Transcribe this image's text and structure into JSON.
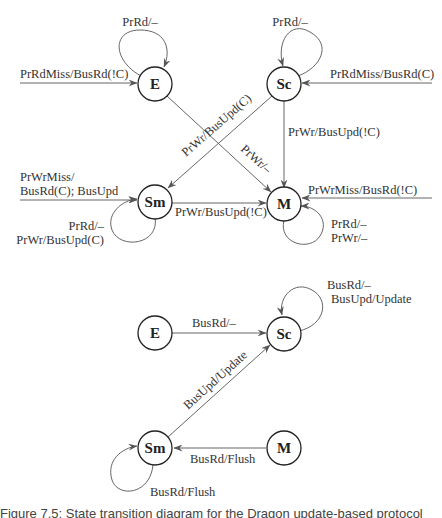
{
  "diagram_top": {
    "nodes": {
      "E": {
        "label": "E"
      },
      "Sc": {
        "label": "Sc"
      },
      "Sm": {
        "label": "Sm"
      },
      "M": {
        "label": "M"
      }
    },
    "edges": {
      "e_self": "PrRd/–",
      "e_in": "PrRdMiss/BusRd(!C)",
      "sc_self": "PrRd/–",
      "sc_in": "PrRdMiss/BusRd(C)",
      "sc_to_sm": "PrWr/BusUpd(C)",
      "e_to_m": "PrWr/–",
      "sc_to_m": "PrWr/BusUpd(!C)",
      "sm_in_line1": "PrWrMiss/",
      "sm_in_line2": "BusRd(C); BusUpd",
      "sm_to_m": "PrWr/BusUpd(!C)",
      "m_in": "PrWrMiss/BusRd(!C)",
      "sm_self_line1": "PrRd/–",
      "sm_self_line2": "PrWr/BusUpd(C)",
      "m_self_line1": "PrRd/–",
      "m_self_line2": "PrWr/–"
    }
  },
  "diagram_bottom": {
    "nodes": {
      "E": {
        "label": "E"
      },
      "Sc": {
        "label": "Sc"
      },
      "Sm": {
        "label": "Sm"
      },
      "M": {
        "label": "M"
      }
    },
    "edges": {
      "e_to_sc": "BusRd/–",
      "sc_self_line1": "BusRd/–",
      "sc_self_line2": "BusUpd/Update",
      "sm_to_sc": "BusUpd/Update",
      "m_to_sm": "BusRd/Flush",
      "sm_self": "BusRd/Flush"
    }
  },
  "caption": "Figure 7.5: State transition diagram for the Dragon update-based protocol"
}
